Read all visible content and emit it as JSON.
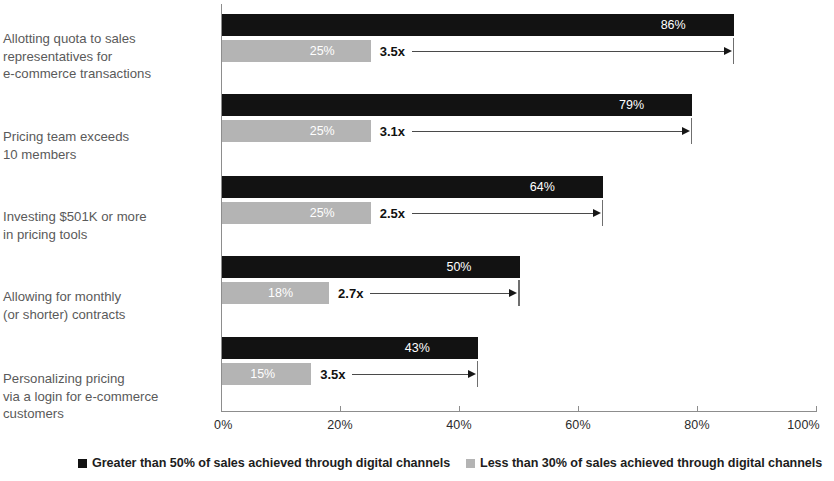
{
  "chart_data": {
    "type": "bar",
    "orientation": "horizontal",
    "title": "",
    "xlabel": "",
    "ylabel": "",
    "xlim": [
      0,
      100
    ],
    "grid": false,
    "legend_position": "bottom",
    "tick_labels": [
      "0%",
      "20%",
      "40%",
      "60%",
      "80%",
      "100%"
    ],
    "tick_values": [
      0,
      20,
      40,
      60,
      80,
      100
    ],
    "categories": [
      "Allotting quota to sales representatives for e-commerce transactions",
      "Pricing team exceeds 10 members",
      "Investing $501K or more in pricing tools",
      "Allowing for monthly (or shorter) contracts",
      "Personalizing pricing via a login for e-commerce customers"
    ],
    "series": [
      {
        "name": "Greater than 50% of sales achieved through digital channels",
        "color": "#121212",
        "values": [
          86,
          79,
          64,
          50,
          43
        ],
        "value_labels": [
          "86%",
          "79%",
          "64%",
          "50%",
          "43%"
        ]
      },
      {
        "name": "Less than 30% of sales achieved through digital channels",
        "color": "#b4b4b4",
        "values": [
          25,
          25,
          25,
          18,
          15
        ],
        "value_labels": [
          "25%",
          "25%",
          "25%",
          "18%",
          "15%"
        ]
      }
    ],
    "annotations": [
      "3.5x",
      "3.1x",
      "2.5x",
      "2.7x",
      "3.5x"
    ]
  },
  "groups": [
    {
      "label_lines": [
        "Allotting quota to sales",
        "representatives for",
        "e-commerce transactions"
      ],
      "dark_value": 86,
      "dark_label": "86%",
      "light_value": 25,
      "light_label": "25%",
      "multiplier": "3.5x"
    },
    {
      "label_lines": [
        "Pricing team exceeds",
        "10 members"
      ],
      "dark_value": 79,
      "dark_label": "79%",
      "light_value": 25,
      "light_label": "25%",
      "multiplier": "3.1x"
    },
    {
      "label_lines": [
        "Investing $501K or more",
        "in pricing tools"
      ],
      "dark_value": 64,
      "dark_label": "64%",
      "light_value": 25,
      "light_label": "25%",
      "multiplier": "2.5x"
    },
    {
      "label_lines": [
        "Allowing for monthly",
        "(or shorter) contracts"
      ],
      "dark_value": 50,
      "dark_label": "50%",
      "light_value": 18,
      "light_label": "18%",
      "multiplier": "2.7x"
    },
    {
      "label_lines": [
        "Personalizing pricing",
        "via a login for e-commerce",
        "customers"
      ],
      "dark_value": 43,
      "dark_label": "43%",
      "light_value": 15,
      "light_label": "15%",
      "multiplier": "3.5x"
    }
  ],
  "axis": {
    "ticks": [
      {
        "label": "0%",
        "value": 0
      },
      {
        "label": "20%",
        "value": 20
      },
      {
        "label": "40%",
        "value": 40
      },
      {
        "label": "60%",
        "value": 60
      },
      {
        "label": "80%",
        "value": 80
      },
      {
        "label": "100%",
        "value": 100
      }
    ]
  },
  "legend": {
    "items": [
      {
        "label": "Greater than 50% of sales achieved through digital channels",
        "color": "#121212"
      },
      {
        "label": "Less than 30% of sales achieved through digital channels",
        "color": "#b4b4b4"
      }
    ]
  }
}
